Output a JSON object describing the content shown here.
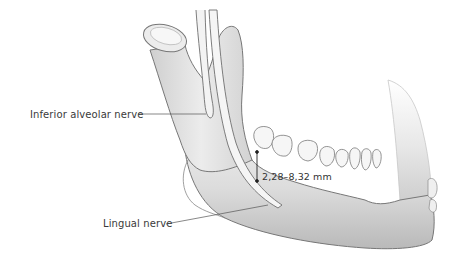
{
  "figure": {
    "background": "#ffffff",
    "bone_fill": "#e4e4e4",
    "bone_stroke": "#7a7a7a",
    "nerve_fill": "#f0f0f0",
    "leader_line_color": "#555555"
  },
  "labels": {
    "inferior_alveolar_nerve": "Inferior alveolar nerve",
    "lingual_nerve": "Lingual nerve",
    "measurement": "2,28–8,32 mm"
  }
}
